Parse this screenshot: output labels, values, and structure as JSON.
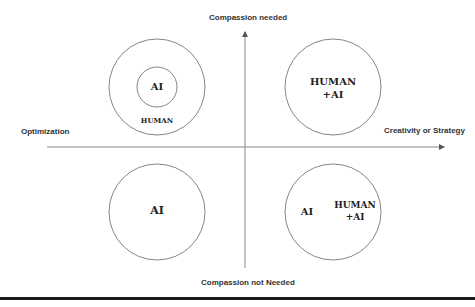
{
  "axes": {
    "top": "Compassion needed",
    "bottom": "Compassion not Needed",
    "left": "Optimization",
    "right": "Creativity or Strategy"
  },
  "quadrants": {
    "top_left": {
      "inner": "AI",
      "outer": "HUMAN"
    },
    "top_right": {
      "line1": "HUMAN",
      "line2": "+AI"
    },
    "bottom_left": {
      "label": "AI"
    },
    "bottom_right": {
      "left": "AI",
      "line1": "HUMAN",
      "line2": "+AI"
    }
  },
  "colors": {
    "line": "#777777",
    "circle": "#666666",
    "bar": "#1a1a1a"
  }
}
